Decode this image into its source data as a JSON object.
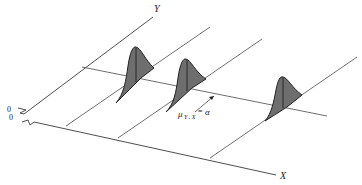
{
  "diagram": {
    "title": "",
    "axes": {
      "y_label": "Y",
      "x_label": "X",
      "origin_labels": [
        "0",
        "0"
      ]
    },
    "annotation": {
      "mu": "μ",
      "subscript": "Y . X",
      "equals": "=",
      "value": "α"
    },
    "distributions": [
      {
        "name": "conditional-distribution-1",
        "position": "near"
      },
      {
        "name": "conditional-distribution-2",
        "position": "middle"
      },
      {
        "name": "conditional-distribution-3",
        "position": "far"
      }
    ],
    "colors": {
      "line": "#3a3a3a",
      "fill": "#6e6e6e",
      "background": "#ffffff"
    }
  }
}
